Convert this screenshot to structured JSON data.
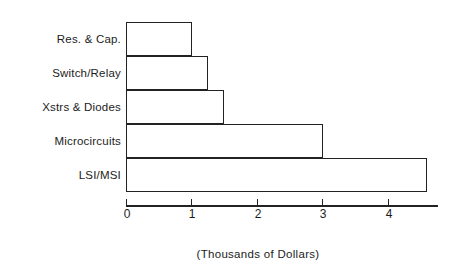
{
  "chart_data": {
    "type": "bar",
    "orientation": "horizontal",
    "title": "",
    "subtitle": "",
    "xlabel": "(Thousands of Dollars)",
    "ylabel": "",
    "categories": [
      "Res. & Cap.",
      "Switch/Relay",
      "Xstrs & Diodes",
      "Microcircuits",
      "LSI/MSI"
    ],
    "values": [
      1.0,
      1.25,
      1.5,
      3.0,
      4.6
    ],
    "xlim": [
      0,
      4.75
    ],
    "xticks": [
      0,
      1,
      2,
      3,
      4
    ],
    "xtick_labels": [
      "0",
      "1",
      "2",
      "3",
      "4"
    ],
    "grid": false,
    "legend": false,
    "bar_style": "outline",
    "bar_fill_color": "#ffffff",
    "bar_edge_color": "#222222",
    "axis_color": "#222222",
    "background_color": "#ffffff"
  }
}
